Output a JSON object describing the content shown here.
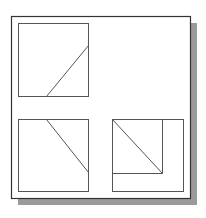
{
  "drawing": {
    "title": "Orthographic projection views",
    "colors": {
      "background": "#ffffff",
      "frame_stroke": "#333333",
      "shadow": "#9a9a9a",
      "line": "#555555"
    },
    "frame": {
      "x": 11,
      "y": 16,
      "w": 179,
      "h": 182,
      "shadow_offset": 7
    },
    "views": [
      {
        "name": "top-left-view",
        "box": {
          "x": 18,
          "y": 23,
          "w": 70,
          "h": 73
        },
        "lines": [
          {
            "x1": 88,
            "y1": 45,
            "x2": 46,
            "y2": 96
          }
        ]
      },
      {
        "name": "bottom-left-view",
        "box": {
          "x": 18,
          "y": 119,
          "w": 70,
          "h": 72
        },
        "lines": [
          {
            "x1": 46,
            "y1": 119,
            "x2": 88,
            "y2": 172
          }
        ]
      },
      {
        "name": "bottom-right-view",
        "box": {
          "x": 112,
          "y": 119,
          "w": 71,
          "h": 72
        },
        "lines": [
          {
            "x1": 162,
            "y1": 119,
            "x2": 162,
            "y2": 173
          },
          {
            "x1": 112,
            "y1": 173,
            "x2": 162,
            "y2": 173
          },
          {
            "x1": 112,
            "y1": 119,
            "x2": 162,
            "y2": 173
          }
        ]
      }
    ]
  }
}
